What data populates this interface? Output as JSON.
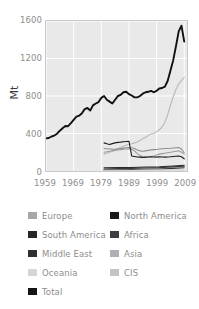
{
  "chart_data": {
    "type": "line",
    "title": "",
    "xlabel": "",
    "ylabel": "Mt",
    "xlim": [
      1959,
      2010
    ],
    "ylim": [
      0,
      1600
    ],
    "grid": true,
    "legend_position": "below",
    "xticks": [
      "1959",
      "1969",
      "1979",
      "1989",
      "1999",
      "2009"
    ],
    "xtick_values": [
      1959,
      1969,
      1979,
      1989,
      1999,
      2009
    ],
    "yticks": [
      "0",
      "400",
      "800",
      "1200",
      "1600"
    ],
    "ytick_values": [
      0,
      400,
      800,
      1200,
      1600
    ],
    "series": [
      {
        "name": "Total",
        "color": "#111111",
        "x": [
          1959,
          1960,
          1961,
          1962,
          1963,
          1964,
          1965,
          1966,
          1967,
          1968,
          1969,
          1970,
          1971,
          1972,
          1973,
          1974,
          1975,
          1976,
          1977,
          1978,
          1979,
          1980,
          1981,
          1982,
          1983,
          1984,
          1985,
          1986,
          1987,
          1988,
          1989,
          1990,
          1991,
          1992,
          1993,
          1994,
          1995,
          1996,
          1997,
          1998,
          1999,
          2000,
          2001,
          2002,
          2003,
          2004,
          2005,
          2006,
          2007,
          2008,
          2009
        ],
        "values": [
          348,
          352,
          368,
          378,
          398,
          430,
          455,
          480,
          478,
          510,
          545,
          580,
          590,
          615,
          660,
          672,
          645,
          700,
          720,
          735,
          780,
          800,
          760,
          740,
          720,
          760,
          800,
          812,
          840,
          845,
          820,
          805,
          785,
          785,
          800,
          825,
          840,
          845,
          855,
          840,
          855,
          880,
          885,
          900,
          960,
          1070,
          1180,
          1330,
          1490,
          1550,
          1380
        ]
      },
      {
        "name": "Asia",
        "color": "#b8b8b8",
        "x": [
          1980,
          1981,
          1982,
          1983,
          1984,
          1985,
          1986,
          1987,
          1988,
          1989,
          1990,
          1991,
          1992,
          1993,
          1994,
          1995,
          1996,
          1997,
          1998,
          1999,
          2000,
          2001,
          2002,
          2003,
          2004,
          2005,
          2006,
          2007,
          2008,
          2009
        ],
        "values": [
          180,
          190,
          200,
          210,
          225,
          240,
          250,
          265,
          275,
          285,
          290,
          300,
          310,
          325,
          345,
          360,
          380,
          395,
          400,
          420,
          440,
          470,
          520,
          600,
          700,
          790,
          870,
          930,
          965,
          1000
        ]
      },
      {
        "name": "CIS",
        "color": "#9d9d9d",
        "x": [
          1980,
          1981,
          1982,
          1983,
          1984,
          1985,
          1986,
          1987,
          1988,
          1989,
          1990,
          1991,
          1992,
          1993,
          1994,
          1995,
          1996,
          1997,
          1998,
          1999,
          2000,
          2001,
          2002,
          2003,
          2004,
          2005,
          2006,
          2007,
          2008,
          2009
        ],
        "values": [
          200,
          205,
          210,
          215,
          220,
          225,
          228,
          232,
          235,
          238,
          230,
          215,
          185,
          165,
          150,
          145,
          150,
          155,
          160,
          170,
          180,
          185,
          190,
          195,
          200,
          205,
          210,
          215,
          200,
          180
        ]
      },
      {
        "name": "Europe",
        "color": "#8f8f8f",
        "x": [
          1980,
          1981,
          1982,
          1983,
          1984,
          1985,
          1986,
          1987,
          1988,
          1989,
          1990,
          1991,
          1992,
          1993,
          1994,
          1995,
          1996,
          1997,
          1998,
          1999,
          2000,
          2001,
          2002,
          2003,
          2004,
          2005,
          2006,
          2007,
          2008,
          2009
        ],
        "values": [
          240,
          238,
          235,
          233,
          232,
          236,
          240,
          244,
          248,
          250,
          248,
          240,
          225,
          215,
          210,
          215,
          220,
          225,
          228,
          230,
          234,
          238,
          240,
          240,
          242,
          245,
          248,
          250,
          235,
          195
        ]
      },
      {
        "name": "North America",
        "color": "#1c1c1c",
        "x": [
          1980,
          1981,
          1982,
          1983,
          1984,
          1985,
          1986,
          1987,
          1988,
          1989,
          1990,
          1991,
          1992,
          1993,
          1994,
          1995,
          1996,
          1997,
          1998,
          1999,
          2000,
          2001,
          2002,
          2003,
          2004,
          2005,
          2006,
          2007,
          2008,
          2009
        ],
        "values": [
          300,
          290,
          282,
          292,
          300,
          305,
          308,
          312,
          315,
          318,
          160,
          155,
          150,
          148,
          145,
          148,
          150,
          152,
          150,
          148,
          152,
          150,
          148,
          150,
          152,
          155,
          158,
          160,
          152,
          130
        ]
      },
      {
        "name": "Africa",
        "color": "#3c3c3c",
        "x": [
          1980,
          1985,
          1990,
          1995,
          2000,
          2005,
          2009
        ],
        "values": [
          22,
          25,
          28,
          32,
          36,
          44,
          52
        ]
      },
      {
        "name": "South America",
        "color": "#2a2a2a",
        "x": [
          1980,
          1985,
          1990,
          1995,
          2000,
          2005,
          2009
        ],
        "values": [
          34,
          36,
          38,
          42,
          46,
          54,
          62
        ]
      },
      {
        "name": "Middle East",
        "color": "#353535",
        "x": [
          1980,
          1985,
          1990,
          1995,
          2000,
          2005,
          2009
        ],
        "values": [
          12,
          14,
          16,
          19,
          22,
          28,
          34
        ]
      },
      {
        "name": "Oceania",
        "color": "#d0d0d0",
        "x": [
          1980,
          1985,
          1990,
          1995,
          2000,
          2005,
          2009
        ],
        "values": [
          7,
          8,
          8,
          9,
          9,
          10,
          9
        ]
      }
    ]
  },
  "axis": {
    "ylabel": "Mt"
  },
  "legend": {
    "left": [
      {
        "label": "Europe",
        "color": "#a7a7a7"
      },
      {
        "label": "South America",
        "color": "#262626"
      },
      {
        "label": "Middle East",
        "color": "#2f2f2f"
      },
      {
        "label": "Oceania",
        "color": "#d6d6d6"
      },
      {
        "label": "Total",
        "color": "#141414"
      }
    ],
    "right": [
      {
        "label": "North America",
        "color": "#1a1a1a"
      },
      {
        "label": "Africa",
        "color": "#3d3d3d"
      },
      {
        "label": "Asia",
        "color": "#b0b0b0"
      },
      {
        "label": "CIS",
        "color": "#c4c4c4"
      }
    ]
  }
}
